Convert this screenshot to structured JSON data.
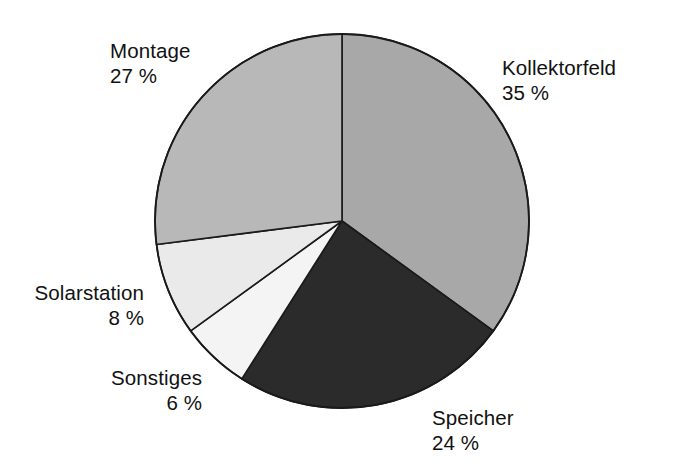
{
  "chart_data": {
    "type": "pie",
    "title": "",
    "unit": "%",
    "labels": [
      "Kollektorfeld",
      "Speicher",
      "Sonstiges",
      "Solarstation",
      "Montage"
    ],
    "values": [
      35,
      24,
      6,
      8,
      27
    ],
    "start_angle_deg": 0,
    "direction": "clockwise",
    "legend": "none",
    "grid": false,
    "slices": [
      {
        "label": "Kollektorfeld",
        "value": 35,
        "value_text": "35 %",
        "color": "#a8a8a8",
        "start_deg": 0.0,
        "sweep_deg": 126.0
      },
      {
        "label": "Speicher",
        "value": 24,
        "value_text": "24 %",
        "color": "#2b2b2b",
        "start_deg": 126.0,
        "sweep_deg": 86.4
      },
      {
        "label": "Sonstiges",
        "value": 6,
        "value_text": "6 %",
        "color": "#f4f4f4",
        "start_deg": 212.4,
        "sweep_deg": 21.6
      },
      {
        "label": "Solarstation",
        "value": 8,
        "value_text": "8 %",
        "color": "#eaeaea",
        "start_deg": 234.0,
        "sweep_deg": 28.8
      },
      {
        "label": "Montage",
        "value": 27,
        "value_text": "27 %",
        "color": "#b8b8b8",
        "start_deg": 262.8,
        "sweep_deg": 97.2
      }
    ],
    "geometry": {
      "cx": 342,
      "cy": 221,
      "r": 187
    },
    "colors": {
      "background": "#ffffff",
      "outline": "#1a1a1a",
      "text": "#111111"
    }
  },
  "labels": {
    "kollektorfeld": {
      "name": "Kollektorfeld",
      "pct": "35 %"
    },
    "speicher": {
      "name": "Speicher",
      "pct": "24 %"
    },
    "sonstiges": {
      "name": "Sonstiges",
      "pct": "6 %"
    },
    "solarstation": {
      "name": "Solarstation",
      "pct": "8 %"
    },
    "montage": {
      "name": "Montage",
      "pct": "27 %"
    }
  }
}
